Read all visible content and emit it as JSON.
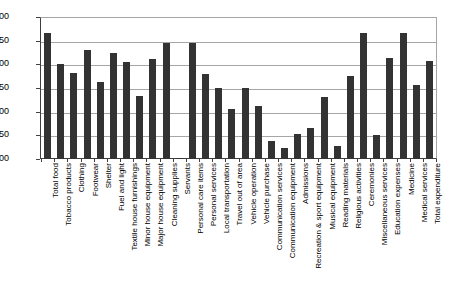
{
  "chart_data": {
    "type": "bar",
    "title": "",
    "xlabel": "",
    "ylabel": "",
    "ylim": [
      0,
      3.0
    ],
    "ytick_step": 0.5,
    "grid": true,
    "legend": "none",
    "bar_color": "#333333",
    "gridline_color": "#a6a6a6",
    "axis_color": "#3f3f3f",
    "ytick_labels": [
      "3.00",
      "2.50",
      "2.00",
      "1.50",
      "1.00",
      "0.50",
      "0.00"
    ],
    "ytick_values": [
      3.0,
      2.5,
      2.0,
      1.5,
      1.0,
      0.5,
      0.0
    ],
    "categories": [
      "Total food",
      "Tobacco products",
      "Clothing",
      "Footwear",
      "Shelter",
      "Fuel and light",
      "Textile house furnishings",
      "Minor house equipment",
      "Major house equipment",
      "Cleaning supplies",
      "Servants",
      "Personal care items",
      "Personal services",
      "Local transportation",
      "Travel out of area",
      "Vehicle operation",
      "Vehicle purchase",
      "Communication services",
      "Communication equipment",
      "Admissions",
      "Recreation & sport equipment",
      "Musical equipment",
      "Reading materials",
      "Religious activities",
      "Ceremonies",
      "Miscellaneous services",
      "Education expenses",
      "Medicine",
      "Medical services",
      "Total expenditure"
    ],
    "values": [
      2.67,
      2.01,
      1.82,
      2.31,
      1.62,
      2.24,
      2.05,
      1.33,
      2.12,
      2.45,
      0.03,
      2.45,
      1.79,
      1.5,
      1.05,
      1.51,
      1.12,
      0.38,
      0.24,
      0.53,
      0.65,
      1.31,
      0.27,
      1.75,
      2.67,
      0.5,
      2.13,
      2.66,
      1.57,
      2.08
    ]
  }
}
